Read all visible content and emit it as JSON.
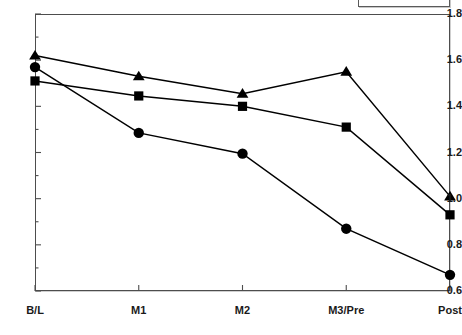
{
  "chart_data": {
    "type": "line",
    "title": "",
    "subtitle": "",
    "xlabel": "",
    "ylabel": "",
    "categories": [
      "B/L",
      "M1",
      "M2",
      "M3/Pre",
      "Post"
    ],
    "ylim": [
      0.6,
      1.8
    ],
    "ytick_labels": [
      "0.6",
      "0.8",
      "1.0",
      "1.2",
      "1.4",
      "1.6",
      "1.8"
    ],
    "ytick_values": [
      0.6,
      0.8,
      1.0,
      1.2,
      1.4,
      1.6,
      1.8
    ],
    "yminor_values": [
      0.7,
      0.9,
      1.1,
      1.3,
      1.5,
      1.7
    ],
    "grid": false,
    "legend_position": "top-right",
    "legend_entries": [],
    "annotations": [],
    "line_color": "#000000",
    "marker_color": "#000000",
    "series": [
      {
        "name": "triangle-series",
        "marker": "triangle",
        "values": [
          1.62,
          1.53,
          1.455,
          1.55,
          1.01
        ]
      },
      {
        "name": "square-series",
        "marker": "square",
        "values": [
          1.51,
          1.445,
          1.4,
          1.31,
          0.93
        ]
      },
      {
        "name": "circle-series",
        "marker": "circle",
        "values": [
          1.57,
          1.285,
          1.195,
          0.87,
          0.67
        ]
      }
    ]
  },
  "legend": {
    "label": ""
  }
}
